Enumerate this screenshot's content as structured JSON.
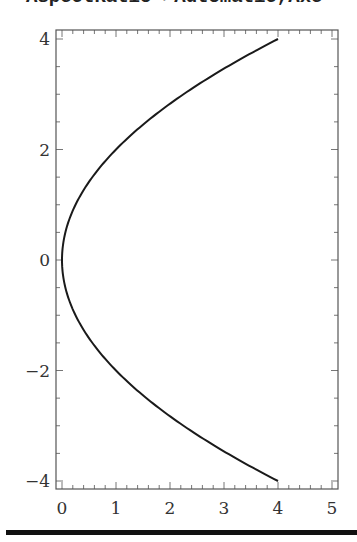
{
  "input_cell": {
    "code_fragment": "AspectRatio->Automatic,Axe"
  },
  "chart_data": {
    "type": "line",
    "title": "",
    "xlabel": "",
    "ylabel": "",
    "xlim": [
      -0.1,
      5.1
    ],
    "ylim": [
      -4.15,
      4.15
    ],
    "grid": false,
    "frame": true,
    "x_ticks": [
      0,
      1,
      2,
      3,
      4,
      5
    ],
    "y_ticks": [
      -4,
      -2,
      0,
      2,
      4
    ],
    "x_tick_labels": [
      "0",
      "1",
      "2",
      "3",
      "4",
      "5"
    ],
    "y_tick_labels": [
      "−4",
      "−2",
      "0",
      "2",
      "4"
    ],
    "series": [
      {
        "name": "parametric curve x = y^2/4",
        "color": "#1a1a1a",
        "x": [
          4,
          3.0625,
          2.25,
          1.5625,
          1,
          0.5625,
          0.25,
          0.0625,
          0,
          0.0625,
          0.25,
          0.5625,
          1,
          1.5625,
          2.25,
          3.0625,
          4
        ],
        "y": [
          -4,
          -3.5,
          -3,
          -2.5,
          -2,
          -1.5,
          -1,
          -0.5,
          0,
          0.5,
          1,
          1.5,
          2,
          2.5,
          3,
          3.5,
          4
        ]
      }
    ]
  },
  "colors": {
    "curve": "#1a1a1a",
    "frame": "#555555",
    "labels": "#333333",
    "divider": "#111111"
  }
}
